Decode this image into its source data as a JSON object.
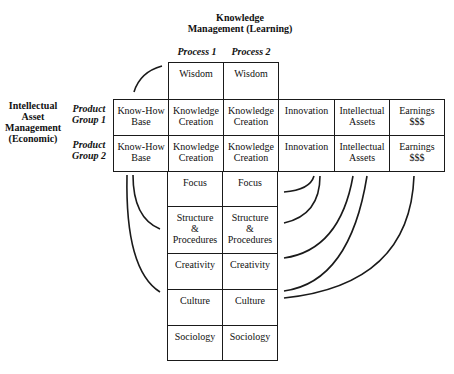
{
  "header": {
    "line1": "Knowledge",
    "line2": "Management (Learning)"
  },
  "processes": [
    "Process 1",
    "Process 2"
  ],
  "left_label": {
    "l1": "Intellectual",
    "l2": "Asset",
    "l3": "Management",
    "l4": "(Economic)"
  },
  "groups": [
    {
      "l1": "Product",
      "l2": "Group 1"
    },
    {
      "l1": "Product",
      "l2": "Group 2"
    }
  ],
  "top_row": [
    "Wisdom",
    "Wisdom"
  ],
  "rows": [
    [
      "Know-How\nBase",
      "Knowledge\nCreation",
      "Knowledge\nCreation",
      "Innovation",
      "Intellectual\nAssets",
      "Earnings\n$$$"
    ],
    [
      "Know-How\nBase",
      "Knowledge\nCreation",
      "Knowledge\nCreation",
      "Innovation",
      "Intellectual\nAssets",
      "Earnings\n$$$"
    ]
  ],
  "lower": [
    [
      "Focus",
      "Focus"
    ],
    [
      "Structure\n&\nProcedures",
      "Structure\n&\nProcedures"
    ],
    [
      "Creativity",
      "Creativity"
    ],
    [
      "Culture",
      "Culture"
    ],
    [
      "Sociology",
      "Sociology"
    ]
  ]
}
